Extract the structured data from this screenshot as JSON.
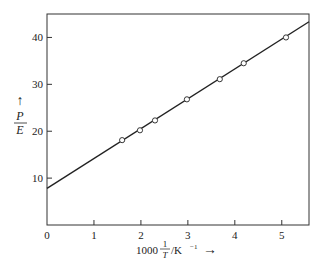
{
  "chart_data": {
    "type": "scatter",
    "title": "",
    "xlabel": {
      "prefix": "1000",
      "frac_num": "1",
      "frac_den": "T",
      "suffix": "/K",
      "sup": "−1",
      "arrow": "→"
    },
    "ylabel": {
      "num": "P",
      "den": "E",
      "arrow": "↑"
    },
    "xlim": [
      0,
      5.58
    ],
    "ylim": [
      0,
      45
    ],
    "xticks": [
      0,
      1,
      2,
      3,
      4,
      5
    ],
    "xtick_labels": [
      "0",
      "1",
      "2",
      "3",
      "4",
      "5"
    ],
    "yticks": [
      10,
      20,
      30,
      40
    ],
    "ytick_labels": [
      "10",
      "20",
      "30",
      "40"
    ],
    "grid": false,
    "legend": "none",
    "series": [
      {
        "name": "measurements",
        "marker": "open-circle",
        "x": [
          1.6,
          1.98,
          2.3,
          2.98,
          3.68,
          4.19,
          5.09
        ],
        "y": [
          18.1,
          20.2,
          22.3,
          26.8,
          31.1,
          34.5,
          40.0
        ]
      },
      {
        "name": "fit-line",
        "style": "line",
        "intercept": 7.8,
        "slope": 6.37
      }
    ]
  }
}
